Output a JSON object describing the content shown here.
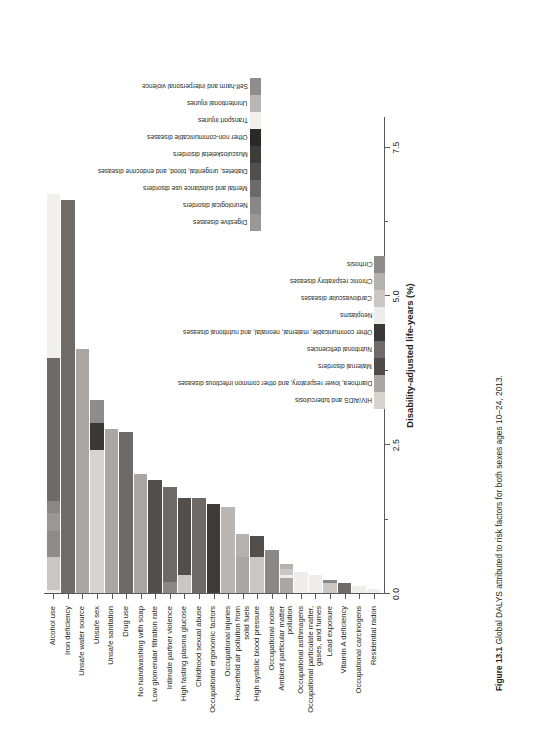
{
  "figure": {
    "number": "Figure 13.1",
    "caption": "Global DALYS attributed to risk factors for both sexes ages 10–24, 2013."
  },
  "axis": {
    "x_title": "Disability-adjusted life-years (%)",
    "x_ticks": [
      "0.0",
      "2.5",
      "5.0",
      "7.5"
    ],
    "x_tick_values": [
      0.0,
      2.5,
      5.0,
      7.5
    ],
    "x_min": 0.0,
    "x_max": 8.0
  },
  "colors": {
    "hiv_aids_tb": "#d7d4d0",
    "diarrhea_lri": "#a9a6a3",
    "maternal": "#4e4b4a",
    "nutritional": "#6e6b69",
    "other_communicable": "#3a3836",
    "neoplasms": "#efedeb",
    "cardiovascular": "#c9c6c3",
    "chronic_respiratory": "#b4b1ae",
    "cirrhosis": "#8e8b88",
    "digestive": "#9a9794",
    "neurological": "#8a8784",
    "mental_substance": "#6d6a67",
    "diabetes_urogenital": "#514e4c",
    "musculoskeletal": "#3e3b39",
    "other_ncd": "#2b2927",
    "transport": "#f2f0ee",
    "unintentional": "#b9b6b3",
    "self_harm": "#8f8c89",
    "axis": "#58595b",
    "text": "#231f20"
  },
  "legend": {
    "column1": [
      {
        "label": "HIV/AIDS and tuberculosis",
        "key": "hiv_aids_tb"
      },
      {
        "label": "Diarrhoea, lower respiratory, and other common infectious diseases",
        "key": "diarrhea_lri"
      },
      {
        "label": "Maternal disorders",
        "key": "maternal"
      },
      {
        "label": "Nutritional deficiencies",
        "key": "nutritional"
      },
      {
        "label": "Other communicable, maternal, neonatal, and nutritional diseases",
        "key": "other_communicable"
      },
      {
        "label": "Neoplasms",
        "key": "neoplasms"
      },
      {
        "label": "Cardiovascular diseases",
        "key": "cardiovascular"
      },
      {
        "label": "Chronic respiratory diseases",
        "key": "chronic_respiratory"
      },
      {
        "label": "Cirrhosis",
        "key": "cirrhosis"
      }
    ],
    "column2": [
      {
        "label": "Digestive diseases",
        "key": "digestive"
      },
      {
        "label": "Neurological disorders",
        "key": "neurological"
      },
      {
        "label": "Mental and substance use disorders",
        "key": "mental_substance"
      },
      {
        "label": "Diabetes, urogenital, blood, and endocrine diseases",
        "key": "diabetes_urogenital"
      },
      {
        "label": "Musculoskeletal disorders",
        "key": "musculoskeletal"
      },
      {
        "label": "Other non-communicable diseases",
        "key": "other_ncd"
      },
      {
        "label": "Transport injuries",
        "key": "transport"
      },
      {
        "label": "Unintentional injuries",
        "key": "unintentional"
      },
      {
        "label": "Self-harm and interpersonal violence",
        "key": "self_harm"
      }
    ]
  },
  "chart_data": {
    "type": "bar",
    "orientation": "horizontal-stacked",
    "title": "Global DALYS attributed to risk factors for both sexes ages 10–24, 2013.",
    "xlabel": "Disability-adjusted life-years (%)",
    "ylabel": "",
    "xlim": [
      0.0,
      8.0
    ],
    "grid": false,
    "legend_position": "right",
    "categories": [
      "Alcohol use",
      "Iron deficiency",
      "Unsafe water source",
      "Unsafe sex",
      "Unsafe sanitation",
      "Drug use",
      "No handwashing with soap",
      "Low glomerular filtration rate",
      "Intimate partner violence",
      "High fasting plasma glucose",
      "Childhood sexual abuse",
      "Occupational ergonomic factors",
      "Occupational injuries",
      "Household air pollution from solid fuels",
      "High systolic blood pressure",
      "Occupational noise",
      "Ambient particular matter pollution",
      "Occupational asthmagens",
      "Occupational particulate matter, gases, and fumes",
      "Lead exposure",
      "Vitamin A deficiency",
      "Occupational carcinogens",
      "Residential radon"
    ],
    "totals": [
      6.7,
      6.6,
      4.1,
      3.25,
      2.75,
      2.7,
      2.0,
      1.9,
      1.78,
      1.6,
      1.6,
      1.5,
      1.45,
      1.0,
      0.95,
      0.72,
      0.48,
      0.35,
      0.3,
      0.22,
      0.16,
      0.12,
      0.06
    ],
    "series": [
      {
        "name": "HIV/AIDS and tuberculosis",
        "key": "hiv_aids_tb",
        "values": [
          0,
          0,
          0,
          2.4,
          0,
          0,
          0,
          0,
          0,
          0,
          0,
          0,
          0,
          0,
          0,
          0,
          0,
          0,
          0,
          0,
          0,
          0,
          0
        ]
      },
      {
        "name": "Diarrhoea, lower respiratory, and other common infectious diseases",
        "key": "diarrhea_lri",
        "values": [
          0,
          0,
          4.1,
          0,
          2.75,
          0,
          2.0,
          0,
          0,
          0,
          0,
          0,
          0,
          0.6,
          0,
          0,
          0.26,
          0,
          0,
          0,
          0,
          0,
          0
        ]
      },
      {
        "name": "Maternal disorders",
        "key": "maternal",
        "values": [
          0,
          0,
          0,
          0,
          0,
          0,
          0,
          0,
          0,
          0,
          0,
          0,
          0,
          0,
          0,
          0,
          0,
          0,
          0,
          0,
          0,
          0,
          0
        ]
      },
      {
        "name": "Nutritional deficiencies",
        "key": "nutritional",
        "values": [
          0,
          6.6,
          0,
          0,
          0,
          0,
          0,
          0,
          0,
          0,
          0,
          0,
          0,
          0,
          0,
          0,
          0,
          0,
          0,
          0,
          0.16,
          0,
          0
        ]
      },
      {
        "name": "Other communicable, maternal, neonatal, and nutritional diseases",
        "key": "other_communicable",
        "values": [
          0,
          0,
          0,
          0.45,
          0,
          0,
          0,
          0,
          0,
          0,
          0,
          0,
          0,
          0,
          0,
          0,
          0,
          0,
          0,
          0,
          0,
          0,
          0
        ]
      },
      {
        "name": "Neoplasms",
        "key": "neoplasms",
        "values": [
          0.05,
          0,
          0,
          0,
          0,
          0,
          0,
          0,
          0,
          0,
          0,
          0,
          0,
          0,
          0,
          0,
          0.04,
          0.35,
          0.3,
          0,
          0,
          0.12,
          0.06
        ]
      },
      {
        "name": "Cardiovascular diseases",
        "key": "cardiovascular",
        "values": [
          0.55,
          0,
          0,
          0,
          0,
          0,
          0,
          0,
          0,
          0.3,
          0,
          0,
          0,
          0,
          0.6,
          0,
          0.1,
          0,
          0,
          0.16,
          0,
          0,
          0
        ]
      },
      {
        "name": "Chronic respiratory diseases",
        "key": "chronic_respiratory",
        "values": [
          0,
          0,
          0,
          0,
          0,
          0,
          0,
          0,
          0,
          0,
          0,
          0,
          0,
          0.4,
          0,
          0,
          0.08,
          0,
          0,
          0,
          0,
          0,
          0
        ]
      },
      {
        "name": "Cirrhosis",
        "key": "cirrhosis",
        "values": [
          0.45,
          0,
          0,
          0,
          0,
          0,
          0,
          0,
          0,
          0,
          0,
          0,
          0,
          0,
          0,
          0,
          0,
          0,
          0,
          0,
          0,
          0,
          0
        ]
      },
      {
        "name": "Digestive diseases",
        "key": "digestive",
        "values": [
          0.3,
          0,
          0,
          0,
          0,
          0,
          0,
          0,
          0,
          0,
          0,
          0,
          0,
          0,
          0,
          0,
          0,
          0,
          0,
          0,
          0,
          0,
          0
        ]
      },
      {
        "name": "Neurological disorders",
        "key": "neurological",
        "values": [
          0.2,
          0,
          0,
          0,
          0,
          0,
          0,
          0,
          0.18,
          0,
          0,
          0,
          0,
          0,
          0,
          0.72,
          0,
          0,
          0,
          0.06,
          0,
          0,
          0
        ]
      },
      {
        "name": "Mental and substance use disorders",
        "key": "mental_substance",
        "values": [
          2.4,
          0,
          0,
          0,
          0,
          2.7,
          0,
          0,
          1.6,
          0,
          1.6,
          0,
          0,
          0,
          0,
          0,
          0,
          0,
          0,
          0,
          0,
          0,
          0
        ]
      },
      {
        "name": "Diabetes, urogenital, blood, and endocrine diseases",
        "key": "diabetes_urogenital",
        "values": [
          0,
          0,
          0,
          0,
          0,
          0,
          0,
          1.9,
          0,
          1.3,
          0,
          0,
          0,
          0,
          0.35,
          0,
          0,
          0,
          0,
          0,
          0,
          0,
          0
        ]
      },
      {
        "name": "Musculoskeletal disorders",
        "key": "musculoskeletal",
        "values": [
          0,
          0,
          0,
          0,
          0,
          0,
          0,
          0,
          0,
          0,
          0,
          1.5,
          0,
          0,
          0,
          0,
          0,
          0,
          0,
          0,
          0,
          0,
          0
        ]
      },
      {
        "name": "Other non-communicable diseases",
        "key": "other_ncd",
        "values": [
          0,
          0,
          0,
          0,
          0,
          0,
          0,
          0,
          0,
          0,
          0,
          0,
          0,
          0,
          0,
          0,
          0,
          0,
          0,
          0,
          0,
          0,
          0
        ]
      },
      {
        "name": "Transport injuries",
        "key": "transport",
        "values": [
          2.75,
          0,
          0,
          0,
          0,
          0,
          0,
          0,
          0,
          0,
          0,
          0,
          0,
          0,
          0,
          0,
          0,
          0,
          0,
          0,
          0,
          0,
          0
        ]
      },
      {
        "name": "Unintentional injuries",
        "key": "unintentional",
        "values": [
          0,
          0,
          0,
          0,
          0,
          0,
          0,
          0,
          0,
          0,
          0,
          0,
          1.45,
          0,
          0,
          0,
          0,
          0,
          0,
          0,
          0,
          0,
          0
        ]
      },
      {
        "name": "Self-harm and interpersonal violence",
        "key": "self_harm",
        "values": [
          0,
          0,
          0,
          0.4,
          0,
          0,
          0,
          0,
          0,
          0,
          0,
          0,
          0,
          0,
          0,
          0,
          0,
          0,
          0,
          0,
          0,
          0,
          0
        ]
      }
    ]
  }
}
